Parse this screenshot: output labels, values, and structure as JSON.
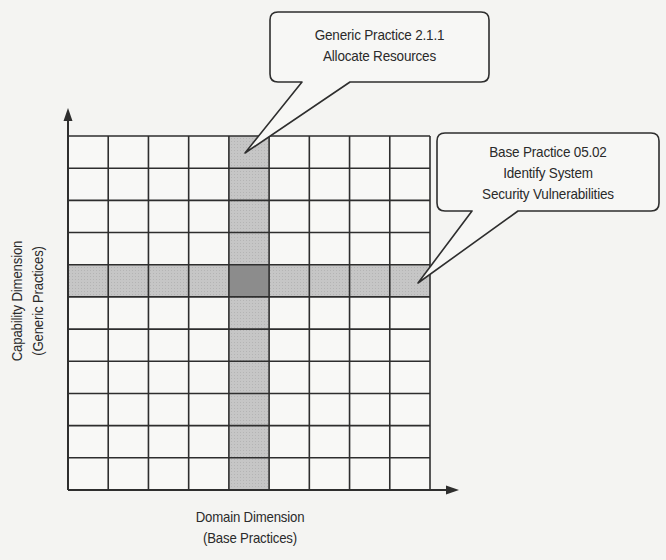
{
  "diagram": {
    "type": "matrix-grid",
    "grid": {
      "columns": 9,
      "rows": 11,
      "highlighted_column_index": 4,
      "highlighted_row_index": 4,
      "colors": {
        "background": "#f4f4f2",
        "cell": "#f8f8f6",
        "grid_line": "#2e2e2e",
        "highlight": "#c6c6c6",
        "intersection": "#8c8c8c"
      }
    },
    "x_axis": {
      "label_line1": "Domain Dimension",
      "label_line2": "(Base Practices)"
    },
    "y_axis": {
      "label_line1": "Capability Dimension",
      "label_line2": "(Generic Practices)"
    },
    "callouts": [
      {
        "line1": "Generic Practice 2.1.1",
        "line2": "Allocate Resources",
        "points_to": "highlighted column"
      },
      {
        "line1": "Base Practice 05.02",
        "line2": "Identify System",
        "line3": "Security Vulnerabilities",
        "points_to": "highlighted row"
      }
    ]
  }
}
